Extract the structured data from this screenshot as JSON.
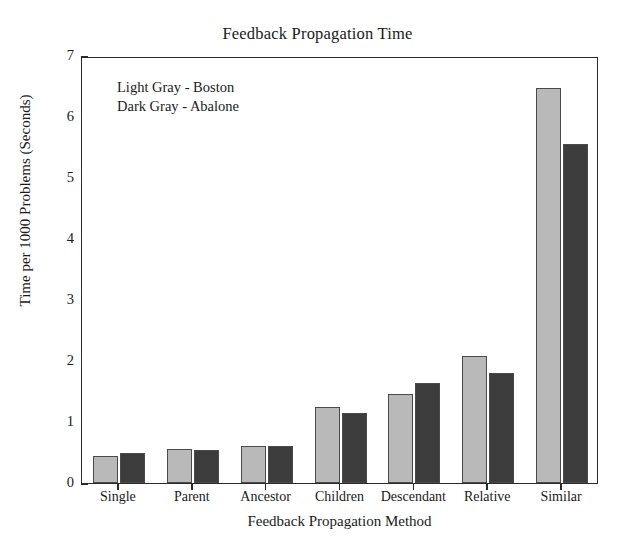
{
  "chart_data": {
    "type": "bar",
    "title": "Feedback Propagation Time",
    "xlabel": "Feedback Propagation Method",
    "ylabel": "Time per 1000 Problems (Seconds)",
    "categories": [
      "Single",
      "Parent",
      "Ancestor",
      "Children",
      "Descendant",
      "Relative",
      "Similar"
    ],
    "series": [
      {
        "name": "Boston",
        "legend_label": "Light Gray - Boston",
        "color": "#b9b9b9",
        "values": [
          0.44,
          0.55,
          0.6,
          1.25,
          1.46,
          2.08,
          6.48
        ]
      },
      {
        "name": "Abalone",
        "legend_label": "Dark Gray - Abalone",
        "color": "#3c3c3c",
        "values": [
          0.49,
          0.54,
          0.61,
          1.15,
          1.64,
          1.8,
          5.55
        ]
      }
    ],
    "ylim": [
      0,
      7
    ],
    "yticks": [
      "0",
      "1",
      "2",
      "3",
      "4",
      "5",
      "6",
      "7"
    ],
    "grid": false,
    "legend_position": "upper-left-inside",
    "axis_color": "#2b2b2b",
    "bar_edge_color": "#4a4a4a"
  }
}
